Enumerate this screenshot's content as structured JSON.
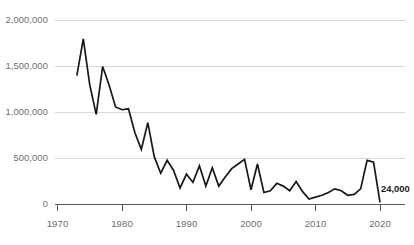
{
  "chart_data": {
    "type": "line",
    "title": "",
    "subtitle": "",
    "xlabel": "",
    "ylabel": "",
    "xlim": [
      1970,
      2021
    ],
    "ylim": [
      0,
      2000000
    ],
    "grid": true,
    "legend": null,
    "x_ticks": [
      1970,
      1980,
      1990,
      2000,
      2010,
      2020
    ],
    "x_tick_labels": [
      "1970",
      "1980",
      "1990",
      "2000",
      "2010",
      "2020"
    ],
    "y_ticks": [
      0,
      500000,
      1000000,
      1500000,
      2000000
    ],
    "y_tick_labels": [
      "0",
      "500,000",
      "1,000,000",
      "1,500,000",
      "2,000,000"
    ],
    "line_color": "#17181a",
    "grid_color": "#d7d7d7",
    "axis_color": "#58595b",
    "annotations": [
      {
        "label": "24,000",
        "x": 2020,
        "y": 24000
      }
    ],
    "x": [
      1973,
      1974,
      1975,
      1976,
      1977,
      1978,
      1979,
      1980,
      1981,
      1982,
      1983,
      1984,
      1985,
      1986,
      1987,
      1988,
      1989,
      1990,
      1991,
      1992,
      1993,
      1994,
      1995,
      1996,
      1997,
      1998,
      1999,
      2000,
      2001,
      2002,
      2003,
      2004,
      2005,
      2006,
      2007,
      2008,
      2009,
      2010,
      2011,
      2012,
      2013,
      2014,
      2015,
      2016,
      2017,
      2018,
      2019,
      2020
    ],
    "values": [
      1400000,
      1800000,
      1300000,
      980000,
      1500000,
      1300000,
      1060000,
      1030000,
      1040000,
      780000,
      600000,
      890000,
      520000,
      340000,
      480000,
      370000,
      180000,
      330000,
      240000,
      420000,
      200000,
      400000,
      200000,
      300000,
      390000,
      440000,
      490000,
      160000,
      440000,
      130000,
      150000,
      230000,
      200000,
      150000,
      250000,
      140000,
      60000,
      80000,
      100000,
      130000,
      170000,
      150000,
      100000,
      110000,
      170000,
      480000,
      460000,
      24000
    ]
  }
}
